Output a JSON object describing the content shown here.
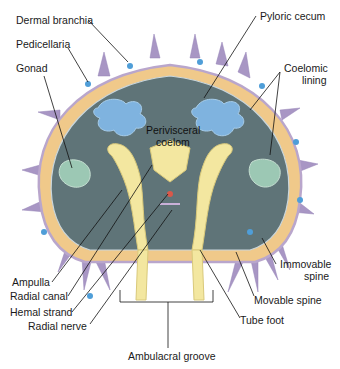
{
  "diagram": {
    "colors": {
      "coelom": "#5f7478",
      "body_wall": "#f0c98a",
      "body_wall_outline": "#b9a6cc",
      "spine": "#a896c4",
      "pedicellaria": "#4f9ed8",
      "pyloric_cecum": "#7fb3df",
      "gonad": "#9cc8b4",
      "ambulacral": "#f3e7a0",
      "label_text": "#1a1a1a",
      "leader_line": "#111111"
    },
    "labels": {
      "dermal_branchia": "Dermal branchia",
      "pedicellaria": "Pedicellaria",
      "gonad": "Gonad",
      "pyloric_cecum": "Pyloric cecum",
      "coelomic_lining_1": "Coelomic",
      "coelomic_lining_2": "lining",
      "perivisceral_1": "Perivisceral",
      "perivisceral_2": "coelom",
      "ampulla": "Ampulla",
      "radial_canal": "Radial canal",
      "hemal_strand": "Hemal strand",
      "radial_nerve": "Radial nerve",
      "immovable_1": "Immovable",
      "immovable_2": "spine",
      "movable_spine": "Movable spine",
      "tube_foot": "Tube foot",
      "ambulacral_groove": "Ambulacral groove"
    }
  }
}
